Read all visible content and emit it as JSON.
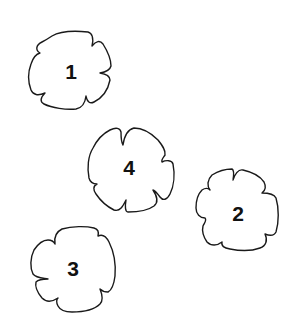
{
  "diagram": {
    "background": "#ffffff",
    "stroke_color": "#1a1a1a",
    "label_color": "#111111",
    "shapes": [
      {
        "id": "shape-1",
        "label": "1",
        "kind": "flower-blob",
        "cx": 71,
        "cy": 71
      },
      {
        "id": "shape-2",
        "label": "2",
        "kind": "flower-blob",
        "cx": 237,
        "cy": 210
      },
      {
        "id": "shape-3",
        "label": "3",
        "kind": "flower-blob",
        "cx": 73,
        "cy": 269
      },
      {
        "id": "shape-4",
        "label": "4",
        "kind": "flower-blob",
        "cx": 131,
        "cy": 169
      }
    ]
  }
}
